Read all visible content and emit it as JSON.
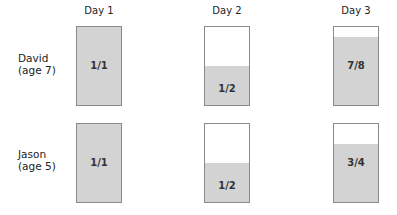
{
  "columns": [
    "Day 1",
    "Day 2",
    "Day 3"
  ],
  "rows": [
    {
      "name": "David",
      "age": "(age 7)",
      "values": [
        "1/1",
        "1/2",
        "7/8"
      ],
      "fractions": [
        1,
        0.5,
        0.875
      ]
    },
    {
      "name": "Jason",
      "age": "(age 5)",
      "values": [
        "1/1",
        "1/2",
        "3/4"
      ],
      "fractions": [
        1,
        0.5,
        0.75
      ]
    }
  ],
  "colors": {
    "fill": "#d3d3d3",
    "border": "#8a8a8a"
  }
}
